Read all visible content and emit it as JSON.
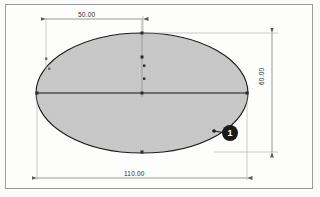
{
  "drawing": {
    "title": "Ellipse dimensioned sketch",
    "background_color": "#fbfbfa",
    "frame_color": "#9b9b9b",
    "shape": {
      "type": "ellipse",
      "fill_color": "#c9c9c9",
      "outline_color": "#1a1a1a",
      "hatch_color": "#bdbdbd",
      "center_x": 142,
      "center_y": 93,
      "radius_x": 106,
      "radius_y": 60
    },
    "dimensions": [
      {
        "name": "width-overall",
        "label": "110.00",
        "orientation": "horizontal",
        "position": "bottom",
        "value": 110.0
      },
      {
        "name": "center-offset",
        "label": "50.00",
        "orientation": "horizontal",
        "position": "top",
        "value": 50.0
      },
      {
        "name": "height-overall",
        "label": "60.00",
        "orientation": "vertical",
        "position": "right",
        "value": 60.0
      }
    ],
    "callout": {
      "label": "1",
      "shape": "filled-circle",
      "color": "#1a1a1a",
      "text_color": "#ffffff"
    },
    "construction_points": [
      {
        "name": "center-point",
        "x": 142,
        "y": 93
      },
      {
        "name": "axis-point-left",
        "x": 37,
        "y": 93
      },
      {
        "name": "axis-point-right",
        "x": 247,
        "y": 93
      },
      {
        "name": "quadrant-point-top",
        "x": 142,
        "y": 33
      },
      {
        "name": "quadrant-point-bottom",
        "x": 142,
        "y": 152
      },
      {
        "name": "control-point-upper",
        "x": 142,
        "y": 57
      },
      {
        "name": "control-point-mid",
        "x": 144,
        "y": 66
      },
      {
        "name": "control-point-lower",
        "x": 144,
        "y": 79
      },
      {
        "name": "callout-attach-point",
        "x": 214,
        "y": 131
      },
      {
        "name": "left-marker-upper",
        "x": 46,
        "y": 59
      },
      {
        "name": "left-marker-lower",
        "x": 49,
        "y": 69
      }
    ]
  }
}
